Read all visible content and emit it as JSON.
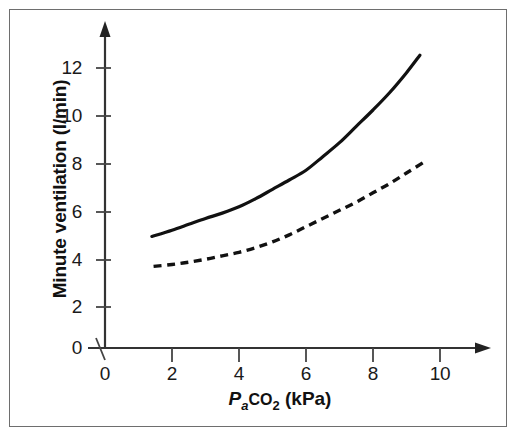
{
  "figure": {
    "border_color": "#6e6e6e",
    "background": "#ffffff"
  },
  "axes": {
    "x_title_parts": {
      "p": "P",
      "a": "a",
      "co": "CO",
      "two": "2",
      "unit": " (kPa)"
    },
    "x_title_plain": "PaCO2 (kPa)",
    "y_title": "Minute ventilation (l/min)",
    "x_ticks": [
      "0",
      "2",
      "4",
      "6",
      "8",
      "10"
    ],
    "y_ticks": [
      "0",
      "2",
      "4",
      "6",
      "8",
      "10",
      "12"
    ]
  },
  "chart_data": {
    "type": "line",
    "title": "",
    "xlabel": "PaCO2 (kPa)",
    "ylabel": "Minute ventilation (l/min)",
    "xlim": [
      0,
      11.5
    ],
    "ylim": [
      0,
      13.5
    ],
    "grid": false,
    "legend_position": "none",
    "x_ticks": [
      0,
      2,
      4,
      6,
      8,
      10
    ],
    "y_ticks": [
      0,
      2,
      4,
      6,
      8,
      10,
      12
    ],
    "series": [
      {
        "name": "Normal CO2 response (solid)",
        "style": "solid",
        "color": "#111111",
        "x": [
          1.4,
          2.0,
          2.5,
          3.0,
          3.5,
          4.0,
          4.5,
          5.0,
          5.5,
          6.0,
          6.5,
          7.0,
          7.5,
          8.0,
          8.5,
          9.0,
          9.4
        ],
        "y": [
          4.78,
          5.05,
          5.3,
          5.55,
          5.78,
          6.05,
          6.4,
          6.8,
          7.2,
          7.62,
          8.2,
          8.8,
          9.5,
          10.2,
          10.95,
          11.8,
          12.55
        ]
      },
      {
        "name": "Depressed CO2 response (dashed)",
        "style": "dashed",
        "color": "#111111",
        "x": [
          1.45,
          2.0,
          2.5,
          3.0,
          3.5,
          4.0,
          4.5,
          5.0,
          5.5,
          6.0,
          6.5,
          7.0,
          7.5,
          8.0,
          8.5,
          9.0,
          9.5
        ],
        "y": [
          3.5,
          3.58,
          3.68,
          3.8,
          3.95,
          4.1,
          4.3,
          4.55,
          4.85,
          5.2,
          5.55,
          5.9,
          6.25,
          6.65,
          7.05,
          7.5,
          7.95
        ]
      }
    ]
  }
}
